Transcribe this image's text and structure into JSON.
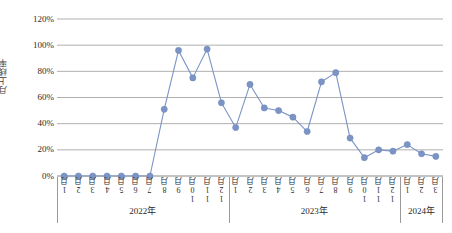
{
  "chart_data": {
    "type": "line",
    "title": "",
    "xlabel": "",
    "ylabel": "月上线率",
    "ylim": [
      0,
      120
    ],
    "ytick_labels": [
      "120%",
      "100%",
      "80%",
      "60%",
      "40%",
      "20%",
      "0%"
    ],
    "ytick_values": [
      120,
      100,
      80,
      60,
      40,
      20,
      0
    ],
    "grid": true,
    "legend": "none",
    "series_color": "#7b94c4",
    "marker_color": "#7b94c4",
    "categories": [
      "1月",
      "2月",
      "3月",
      "4月",
      "5月",
      "6月",
      "7月",
      "8月",
      "9月",
      "10月",
      "11月",
      "12月",
      "1月",
      "2月",
      "3月",
      "4月",
      "5月",
      "6月",
      "7月",
      "8月",
      "9月",
      "10月",
      "11月",
      "12月",
      "1月",
      "2月",
      "3月"
    ],
    "year_groups": [
      {
        "label": "2022年",
        "start_index": 0,
        "count": 12
      },
      {
        "label": "2023年",
        "start_index": 12,
        "count": 12
      },
      {
        "label": "2024年",
        "start_index": 24,
        "count": 3
      }
    ],
    "series": [
      {
        "name": "月上线率",
        "values": [
          0,
          0,
          0,
          0,
          0,
          0,
          0,
          51,
          96,
          75,
          97,
          56,
          37,
          70,
          52,
          50,
          45,
          34,
          72,
          79,
          29,
          14,
          20,
          19,
          24,
          17,
          15
        ]
      }
    ]
  }
}
